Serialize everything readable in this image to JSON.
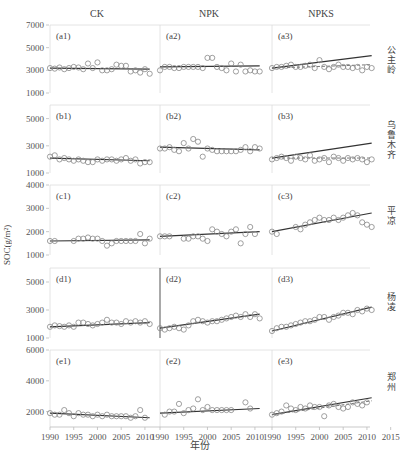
{
  "figure": {
    "ylabel": "SOC(g/m²)",
    "xlabel": "年份",
    "columns": [
      "CK",
      "NPK",
      "NPKS"
    ],
    "sites": [
      "公主岭",
      "乌鲁木齐",
      "平凉",
      "杨凌",
      "郑州"
    ],
    "x_ticks": [
      "1990",
      "1995",
      "2000",
      "2005",
      "2010"
    ],
    "x_ticks_last": [
      "1990",
      "1995",
      "2000",
      "2005",
      "2010",
      "2015"
    ]
  },
  "chart_data": {
    "type": "scatter",
    "title": "",
    "xlabel": "年份",
    "ylabel": "SOC(g/m²)",
    "xlim": [
      1990,
      2015
    ],
    "grid": false,
    "legend_position": "none",
    "layout": "5 rows (sites) x 3 columns (treatments)",
    "columns": [
      "CK",
      "NPK",
      "NPKS"
    ],
    "rows": [
      {
        "site": "公主岭",
        "ylim": [
          1000,
          7000
        ],
        "yticks": [
          1000,
          3000,
          5000,
          7000
        ],
        "panels": [
          {
            "label": "(a1)",
            "treatment": "CK",
            "obs_x": [
              1990,
              1991,
              1992,
              1993,
              1994,
              1995,
              1996,
              1997,
              1998,
              1999,
              2000,
              2001,
              2002,
              2003,
              2004,
              2005,
              2006,
              2007,
              2008,
              2009,
              2010,
              2011
            ],
            "obs_y": [
              3200,
              3150,
              3250,
              3100,
              3200,
              3300,
              3250,
              3100,
              3600,
              3200,
              3700,
              3000,
              3000,
              3100,
              3500,
              3400,
              3400,
              2900,
              3000,
              2800,
              3100,
              2700
            ],
            "sim_y_start": 3200,
            "sim_y_end": 3100
          },
          {
            "label": "(a2)",
            "treatment": "NPK",
            "obs_x": [
              1990,
              1991,
              1992,
              1993,
              1994,
              1995,
              1996,
              1997,
              1998,
              1999,
              2000,
              2001,
              2002,
              2003,
              2004,
              2005,
              2006,
              2007,
              2008,
              2009,
              2010,
              2011
            ],
            "obs_y": [
              3000,
              3300,
              3300,
              3200,
              3200,
              3300,
              3300,
              3300,
              3300,
              3200,
              4100,
              4100,
              3300,
              3200,
              3000,
              3600,
              2900,
              3500,
              2900,
              3000,
              2900,
              2900
            ],
            "sim_y_start": 3300,
            "sim_y_end": 3400
          },
          {
            "label": "(a3)",
            "treatment": "NPKS",
            "obs_x": [
              1990,
              1991,
              1992,
              1993,
              1994,
              1995,
              1996,
              1997,
              1998,
              1999,
              2000,
              2001,
              2002,
              2003,
              2004,
              2005,
              2006,
              2007,
              2008,
              2009,
              2010,
              2011
            ],
            "obs_y": [
              3200,
              3300,
              3300,
              3400,
              3500,
              3300,
              3300,
              3400,
              3500,
              3200,
              3900,
              3300,
              3100,
              3300,
              3500,
              3300,
              3300,
              3200,
              3300,
              3000,
              3300,
              3200
            ],
            "sim_y_start": 3200,
            "sim_y_end": 4300,
            "sim2_y_start": 3200,
            "sim2_y_end": 3500
          }
        ]
      },
      {
        "site": "乌鲁木齐",
        "ylim": [
          1000,
          6000
        ],
        "yticks": [
          1000,
          3000,
          5000
        ],
        "panels": [
          {
            "label": "(b1)",
            "treatment": "CK",
            "obs_x": [
              1990,
              1991,
              1992,
              1993,
              1994,
              1995,
              1996,
              1997,
              1998,
              1999,
              2000,
              2001,
              2002,
              2003,
              2004,
              2005,
              2006,
              2007,
              2008,
              2009,
              2010,
              2011
            ],
            "obs_y": [
              2200,
              2300,
              2000,
              2100,
              2000,
              1900,
              2000,
              1900,
              1800,
              1800,
              2000,
              1900,
              2000,
              2000,
              1900,
              2000,
              2100,
              1900,
              2000,
              1700,
              1800,
              1800
            ],
            "sim_y_start": 2100,
            "sim_y_end": 1900
          },
          {
            "label": "(b2)",
            "treatment": "NPK",
            "obs_x": [
              1990,
              1991,
              1992,
              1993,
              1994,
              1995,
              1996,
              1997,
              1998,
              1999,
              2000,
              2001,
              2002,
              2003,
              2004,
              2005,
              2006,
              2007,
              2008,
              2009,
              2010,
              2011
            ],
            "obs_y": [
              2800,
              2800,
              2900,
              2700,
              2600,
              3200,
              2800,
              3500,
              3300,
              2200,
              2800,
              2700,
              2600,
              2600,
              2600,
              2600,
              2600,
              2700,
              2900,
              2600,
              2900,
              2800
            ],
            "sim_y_start": 2900,
            "sim_y_end": 2700
          },
          {
            "label": "(b3)",
            "treatment": "NPKS",
            "obs_x": [
              1990,
              1991,
              1992,
              1993,
              1994,
              1995,
              1996,
              1997,
              1998,
              1999,
              2000,
              2001,
              2002,
              2003,
              2004,
              2005,
              2006,
              2007,
              2008,
              2009,
              2010,
              2011
            ],
            "obs_y": [
              2000,
              2100,
              2200,
              2100,
              1900,
              2200,
              2100,
              2000,
              2300,
              1900,
              2000,
              2100,
              1800,
              2200,
              2100,
              1900,
              2100,
              2000,
              2100,
              2000,
              1800,
              2000
            ],
            "sim_y_start": 2100,
            "sim_y_end": 3200,
            "sim2_y_start": 2100,
            "sim2_y_end": 2100
          }
        ]
      },
      {
        "site": "平凉",
        "ylim": [
          1000,
          4000
        ],
        "yticks": [
          1000,
          2000,
          3000,
          4000
        ],
        "panels": [
          {
            "label": "(c1)",
            "treatment": "CK",
            "obs_x": [
              1990,
              1991,
              1995,
              1996,
              1997,
              1998,
              1999,
              2000,
              2001,
              2002,
              2003,
              2004,
              2005,
              2006,
              2007,
              2008,
              2009,
              2010,
              2011
            ],
            "obs_y": [
              1600,
              1600,
              1600,
              1700,
              1700,
              1750,
              1700,
              1700,
              1600,
              1400,
              1500,
              1600,
              1600,
              1600,
              1600,
              1600,
              1900,
              1500,
              1700
            ],
            "sim_y_start": 1600,
            "sim_y_end": 1650
          },
          {
            "label": "(c2)",
            "treatment": "NPK",
            "obs_x": [
              1990,
              1991,
              1992,
              1995,
              1996,
              1997,
              1998,
              1999,
              2000,
              2001,
              2002,
              2003,
              2004,
              2005,
              2006,
              2007,
              2008,
              2009,
              2010
            ],
            "obs_y": [
              1800,
              1800,
              1800,
              1700,
              1700,
              1800,
              1800,
              1700,
              1600,
              2100,
              2000,
              1900,
              1800,
              2000,
              2100,
              1500,
              1900,
              2200,
              1900
            ],
            "sim_y_start": 1800,
            "sim_y_end": 2000
          },
          {
            "label": "(c3)",
            "treatment": "NPKS",
            "obs_x": [
              1990,
              1991,
              1995,
              1996,
              1997,
              1998,
              1999,
              2000,
              2001,
              2002,
              2003,
              2004,
              2005,
              2006,
              2007,
              2008,
              2009,
              2010,
              2011
            ],
            "obs_y": [
              2000,
              1900,
              2200,
              2100,
              2300,
              2400,
              2500,
              2600,
              2500,
              2500,
              2600,
              2500,
              2600,
              2700,
              2800,
              2700,
              2400,
              2300,
              2200
            ],
            "sim_y_start": 2000,
            "sim_y_end": 2800
          }
        ]
      },
      {
        "site": "杨凌",
        "ylim": [
          1000,
          6000
        ],
        "yticks": [
          1000,
          3000,
          5000
        ],
        "panels": [
          {
            "label": "(d1)",
            "treatment": "CK",
            "obs_x": [
              1990,
              1991,
              1992,
              1993,
              1994,
              1995,
              1996,
              1997,
              1998,
              1999,
              2000,
              2001,
              2002,
              2003,
              2004,
              2005,
              2006,
              2007,
              2008,
              2009,
              2010,
              2011
            ],
            "obs_y": [
              1800,
              1900,
              1850,
              1800,
              1900,
              1800,
              2100,
              2100,
              2000,
              1900,
              2000,
              2100,
              2300,
              2100,
              2100,
              2000,
              2200,
              2100,
              2200,
              2100,
              2200,
              2000
            ],
            "sim_y_start": 1800,
            "sim_y_end": 2100
          },
          {
            "label": "(d2)",
            "treatment": "NPK",
            "obs_x": [
              1990,
              1991,
              1992,
              1993,
              1994,
              1995,
              1996,
              1997,
              1998,
              1999,
              2000,
              2001,
              2002,
              2003,
              2004,
              2005,
              2006,
              2007,
              2008,
              2009,
              2010,
              2011
            ],
            "obs_y": [
              1700,
              1600,
              1700,
              1800,
              1700,
              1600,
              1900,
              2200,
              2300,
              2200,
              2100,
              2200,
              2200,
              2300,
              2400,
              2500,
              2600,
              2500,
              2700,
              2500,
              2700,
              2400
            ],
            "sim_y_start": 1700,
            "sim_y_end": 2700
          },
          {
            "label": "(d3)",
            "treatment": "NPKS",
            "obs_x": [
              1990,
              1991,
              1992,
              1993,
              1994,
              1995,
              1996,
              1997,
              1998,
              1999,
              2000,
              2001,
              2002,
              2003,
              2004,
              2005,
              2006,
              2007,
              2008,
              2009,
              2010,
              2011
            ],
            "obs_y": [
              1500,
              1700,
              1800,
              1800,
              1900,
              2000,
              2100,
              2200,
              2200,
              2300,
              2500,
              2500,
              2300,
              2500,
              2600,
              2800,
              2800,
              2700,
              3000,
              2900,
              3100,
              3000
            ],
            "sim_y_start": 1500,
            "sim_y_end": 3200
          }
        ]
      },
      {
        "site": "郑州",
        "ylim": [
          1000,
          6000
        ],
        "yticks": [
          2000,
          4000,
          6000
        ],
        "panels": [
          {
            "label": "(e1)",
            "treatment": "CK",
            "obs_x": [
              1990,
              1991,
              1992,
              1993,
              1994,
              1995,
              1996,
              1997,
              1998,
              1999,
              2000,
              2001,
              2002,
              2003,
              2004,
              2005,
              2006,
              2007,
              2008,
              2009,
              2010
            ],
            "obs_y": [
              1900,
              1800,
              1800,
              2100,
              1900,
              1700,
              1900,
              1800,
              1800,
              1700,
              1800,
              1700,
              1800,
              1700,
              1700,
              1700,
              1700,
              1600,
              1700,
              2100,
              1600
            ],
            "sim_y_start": 1900,
            "sim_y_end": 1600
          },
          {
            "label": "(e2)",
            "treatment": "NPK",
            "obs_x": [
              1991,
              1992,
              1993,
              1994,
              1995,
              1996,
              1997,
              1998,
              1999,
              2000,
              2001,
              2002,
              2003,
              2004,
              2005,
              2008,
              2009
            ],
            "obs_y": [
              1800,
              2000,
              2000,
              2500,
              1900,
              2100,
              2200,
              2800,
              2100,
              2300,
              2100,
              2100,
              2100,
              2100,
              2100,
              2600,
              2200
            ],
            "sim_y_start": 1900,
            "sim_y_end": 2200
          },
          {
            "label": "(e3)",
            "treatment": "NPKS",
            "obs_x": [
              1990,
              1991,
              1992,
              1993,
              1994,
              1995,
              1996,
              1997,
              1998,
              1999,
              2000,
              2001,
              2002,
              2003,
              2004,
              2005,
              2006,
              2007,
              2008,
              2009,
              2010
            ],
            "obs_y": [
              1800,
              1900,
              2000,
              2400,
              2200,
              2100,
              2300,
              2200,
              2400,
              2300,
              2300,
              1700,
              2400,
              2500,
              2300,
              2200,
              2300,
              2600,
              2500,
              2400,
              2600
            ],
            "sim_y_start": 1800,
            "sim_y_end": 2900,
            "sim2_y_start": 1800,
            "sim2_y_end": 2700
          }
        ]
      }
    ]
  }
}
